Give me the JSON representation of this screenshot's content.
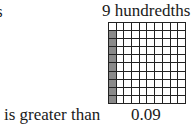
{
  "left_fragment": "s",
  "model": {
    "title": "9 hundredths",
    "grid": {
      "rows": 10,
      "cols": 10,
      "shaded_column": 0,
      "shaded_rows_from": 1,
      "shaded_count": 9,
      "shade_color": "#8a8a8a"
    },
    "value": "0.09"
  },
  "comparison_text": "is greater than"
}
